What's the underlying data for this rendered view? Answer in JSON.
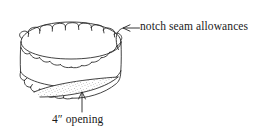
{
  "figure": {
    "ink_color": "#222222",
    "stipple_color": "#6b6b6b",
    "background_color": "#ffffff"
  },
  "annotations": [
    {
      "id": "notch-seam-allowances",
      "text": "notch seam allowances",
      "leader": "arrow pointing left to the top rim notches"
    },
    {
      "id": "four-inch-opening",
      "text": "4″ opening",
      "leader": "arrow pointing up to the stippled bottom opening"
    }
  ],
  "geometry": {
    "top_rim_notch_count": 12,
    "mid_band_scallop_count": 11,
    "bottom_rim_notch_count": 12
  }
}
